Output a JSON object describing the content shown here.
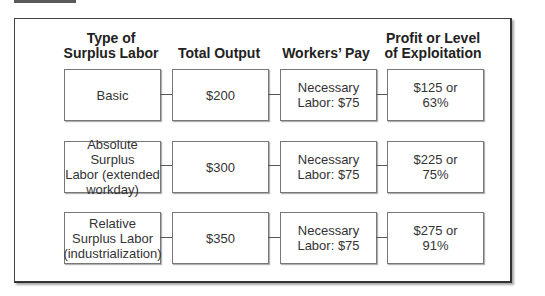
{
  "headers": [
    "Type of Surplus Labor",
    "Total Output",
    "Workers' Pay",
    "Profit or Level of Exploitation"
  ],
  "headers_lines": [
    [
      "Type of",
      "Surplus Labor"
    ],
    [
      "Total Output"
    ],
    [
      "Workers’ Pay"
    ],
    [
      "Profit or Level",
      "of Exploitation"
    ]
  ],
  "rows": [
    {
      "type_lines": [
        "Basic"
      ],
      "total_output": "$200",
      "workers_pay_lines": [
        "Necessary",
        "Labor: $75"
      ],
      "profit_lines": [
        "$125 or",
        "63%"
      ]
    },
    {
      "type_lines": [
        "Absolute Surplus",
        "Labor (extended",
        "workday)"
      ],
      "total_output": "$300",
      "workers_pay_lines": [
        "Necessary",
        "Labor: $75"
      ],
      "profit_lines": [
        "$225 or",
        "75%"
      ]
    },
    {
      "type_lines": [
        "Relative",
        "Surplus Labor",
        "(industrialization)"
      ],
      "total_output": "$350",
      "workers_pay_lines": [
        "Necessary",
        "Labor: $75"
      ],
      "profit_lines": [
        "$275 or",
        "91%"
      ]
    }
  ]
}
